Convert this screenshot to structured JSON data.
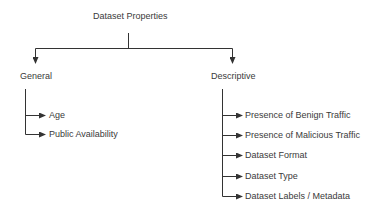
{
  "diagram": {
    "root": {
      "label": "Dataset Properties"
    },
    "categories": [
      {
        "label": "General",
        "children": [
          {
            "label": "Age"
          },
          {
            "label": "Public Availability"
          }
        ]
      },
      {
        "label": "Descriptive",
        "children": [
          {
            "label": "Presence of Benign Traffic"
          },
          {
            "label": "Presence of Malicious Traffic"
          },
          {
            "label": "Dataset Format"
          },
          {
            "label": "Dataset Type"
          },
          {
            "label": "Dataset Labels / Metadata"
          }
        ]
      }
    ],
    "colors": {
      "line": "#333333",
      "text": "#3a3a3a",
      "background": "#ffffff"
    }
  }
}
